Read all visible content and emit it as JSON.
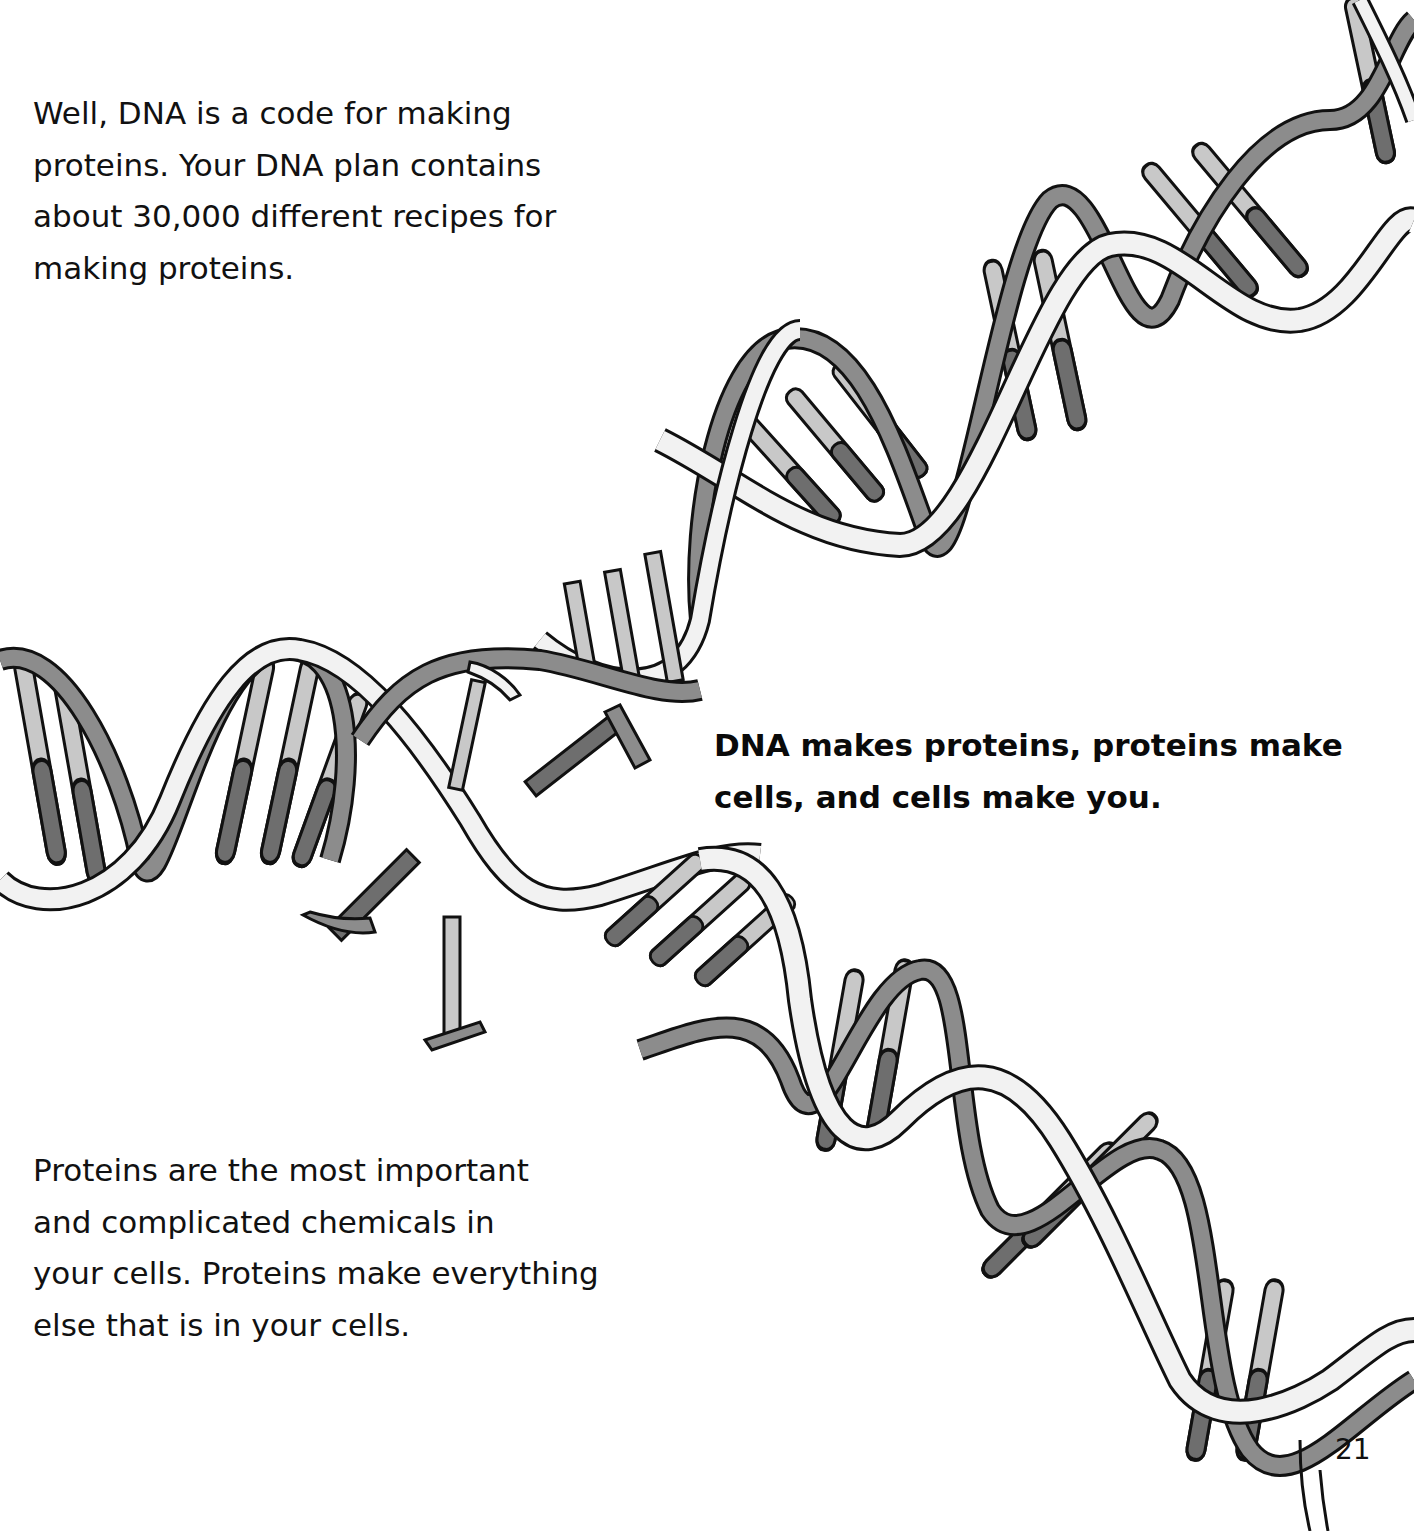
{
  "page": {
    "paragraph_top": {
      "lines": [
        "Well, DNA is a code for making",
        "proteins. Your DNA plan contains",
        "about 30,000 different recipes for",
        "making proteins."
      ]
    },
    "callout": {
      "lines": [
        "DNA makes proteins, proteins make",
        "cells, and cells make you."
      ]
    },
    "paragraph_bottom": {
      "lines": [
        "Proteins are the most important",
        "and complicated chemicals in",
        "your cells. Proteins make everything",
        "else that is in your cells."
      ]
    },
    "page_number": "21"
  },
  "illustration": {
    "subject": "DNA double helix unzipping with loose nucleotide base pieces",
    "colors": {
      "outline": "#111111",
      "backbone_light": "#f2f2f2",
      "backbone_dark": "#8c8c8c",
      "base_light": "#c8c8c8",
      "base_dark": "#6e6e6e"
    }
  }
}
